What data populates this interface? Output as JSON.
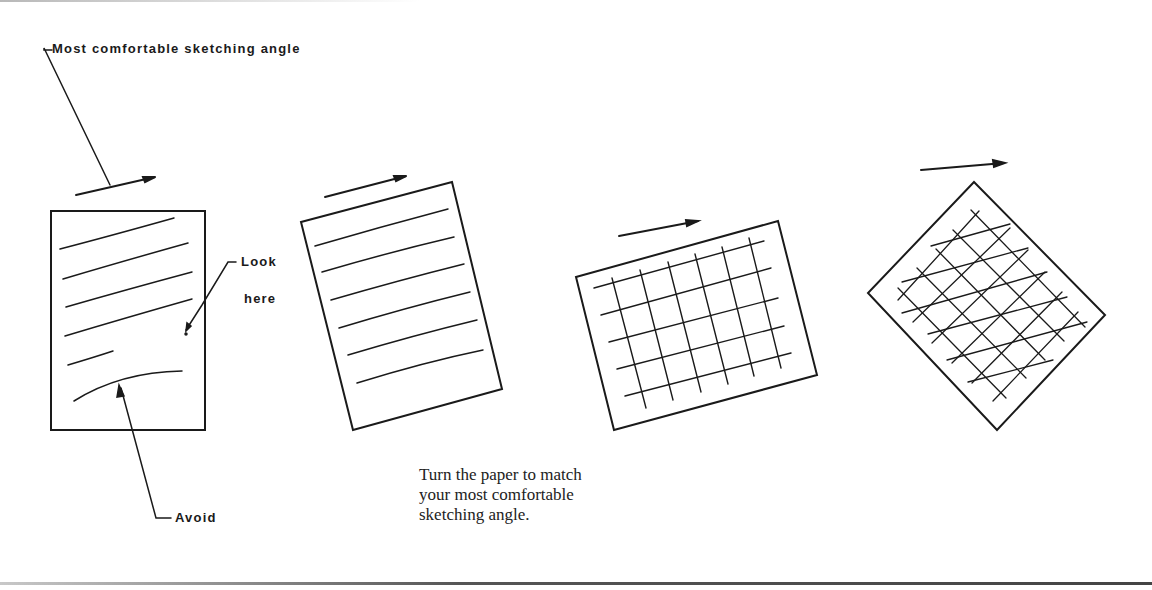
{
  "labels": {
    "comfortable_angle": "Most comfortable sketching angle",
    "look": "Look",
    "here": "here",
    "avoid": "Avoid"
  },
  "caption": {
    "line1": "Turn the paper to match",
    "line2": "your most comfortable",
    "line3": "sketching angle."
  },
  "figures": [
    {
      "name": "upright-sheet-with-strokes",
      "rotation_deg": 0,
      "lines": 6,
      "grid": false
    },
    {
      "name": "tilted-sheet-with-lines",
      "rotation_deg": -15,
      "lines": 6,
      "grid": false
    },
    {
      "name": "tilted-sheet-with-grid",
      "rotation_deg": -20,
      "grid": true
    },
    {
      "name": "diamond-sheet-with-grid",
      "rotation_deg": 45,
      "grid": true
    }
  ],
  "colors": {
    "ink": "#1a1a1a",
    "background": "#ffffff"
  }
}
